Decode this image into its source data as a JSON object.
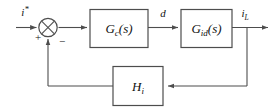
{
  "diagram": {
    "type": "control-system-block-diagram",
    "colors": {
      "line": "#4d4d4d",
      "text": "#111111",
      "background": "#ffffff"
    },
    "signals": {
      "reference": {
        "base": "i",
        "sup": "*",
        "full": "i*"
      },
      "duty": {
        "base": "d",
        "full": "d"
      },
      "output": {
        "base": "i",
        "sub": "L",
        "full": "iL"
      }
    },
    "summing_junction": {
      "name": "summing-junction",
      "plus_sign": "+",
      "minus_sign": "−",
      "style": "circle-with-cross"
    },
    "blocks": [
      {
        "id": "controller",
        "base": "G",
        "sub": "c",
        "arg": "(s)",
        "full": "Gc(s)"
      },
      {
        "id": "plant",
        "base": "G",
        "sub": "id",
        "arg": "(s)",
        "full": "Gid(s)"
      },
      {
        "id": "feedback",
        "base": "H",
        "sub": "i",
        "arg": "",
        "full": "Hi"
      }
    ]
  }
}
